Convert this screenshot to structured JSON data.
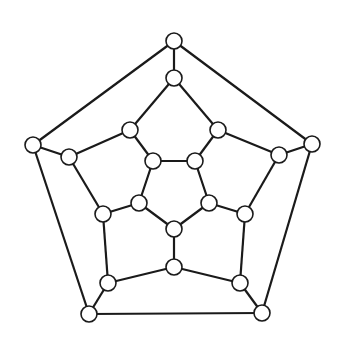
{
  "diagram": {
    "type": "dodecahedral-graph",
    "node_radius": 8,
    "colors": {
      "stroke": "#1a1a1a",
      "node_fill": "#ffffff",
      "background": "#ffffff"
    },
    "nodes": [
      {
        "id": 0,
        "x": 174,
        "y": 41
      },
      {
        "id": 1,
        "x": 312,
        "y": 144
      },
      {
        "id": 2,
        "x": 262,
        "y": 313
      },
      {
        "id": 3,
        "x": 89,
        "y": 314
      },
      {
        "id": 4,
        "x": 33,
        "y": 145
      },
      {
        "id": 5,
        "x": 174,
        "y": 78
      },
      {
        "id": 6,
        "x": 218,
        "y": 130
      },
      {
        "id": 7,
        "x": 279,
        "y": 155
      },
      {
        "id": 8,
        "x": 245,
        "y": 214
      },
      {
        "id": 9,
        "x": 240,
        "y": 283
      },
      {
        "id": 10,
        "x": 174,
        "y": 267
      },
      {
        "id": 11,
        "x": 108,
        "y": 283
      },
      {
        "id": 12,
        "x": 103,
        "y": 214
      },
      {
        "id": 13,
        "x": 69,
        "y": 157
      },
      {
        "id": 14,
        "x": 130,
        "y": 130
      },
      {
        "id": 15,
        "x": 153,
        "y": 161
      },
      {
        "id": 16,
        "x": 195,
        "y": 161
      },
      {
        "id": 17,
        "x": 209,
        "y": 203
      },
      {
        "id": 18,
        "x": 174,
        "y": 229
      },
      {
        "id": 19,
        "x": 139,
        "y": 203
      }
    ],
    "edges": [
      [
        0,
        1
      ],
      [
        1,
        2
      ],
      [
        2,
        3
      ],
      [
        3,
        4
      ],
      [
        4,
        0
      ],
      [
        0,
        5
      ],
      [
        1,
        7
      ],
      [
        2,
        9
      ],
      [
        3,
        11
      ],
      [
        4,
        13
      ],
      [
        5,
        6
      ],
      [
        6,
        7
      ],
      [
        7,
        8
      ],
      [
        8,
        9
      ],
      [
        9,
        10
      ],
      [
        10,
        11
      ],
      [
        11,
        12
      ],
      [
        12,
        13
      ],
      [
        13,
        14
      ],
      [
        14,
        5
      ],
      [
        6,
        16
      ],
      [
        8,
        17
      ],
      [
        10,
        18
      ],
      [
        12,
        19
      ],
      [
        14,
        15
      ],
      [
        15,
        16
      ],
      [
        16,
        17
      ],
      [
        17,
        18
      ],
      [
        18,
        19
      ],
      [
        19,
        15
      ]
    ]
  }
}
